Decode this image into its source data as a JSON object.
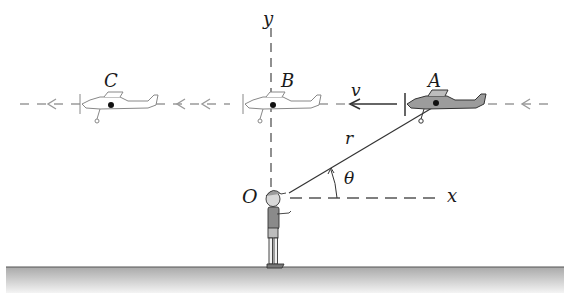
{
  "diagram": {
    "labels": {
      "y_axis": "y",
      "x_axis": "x",
      "origin": "O",
      "plane_a": "A",
      "plane_b": "B",
      "plane_c": "C",
      "velocity": "v",
      "radius": "r",
      "angle": "θ"
    },
    "colors": {
      "ink": "#1a1a1a",
      "dashed_line": "#9a9a9a",
      "plane_a_fill": "#9c9c9c",
      "ghost_plane": "#8a8a8a",
      "ground_top": "#b5b5b5",
      "ground_bottom": "#f2f2f2"
    },
    "elements": {
      "flight_path": "horizontal dashed line with left-pointing arrowheads",
      "planes": [
        "C (faded)",
        "B (faded)",
        "A (solid, gray fill)"
      ],
      "observer": "child holding control line at origin O",
      "ground": "shaded gray ground strip"
    }
  }
}
